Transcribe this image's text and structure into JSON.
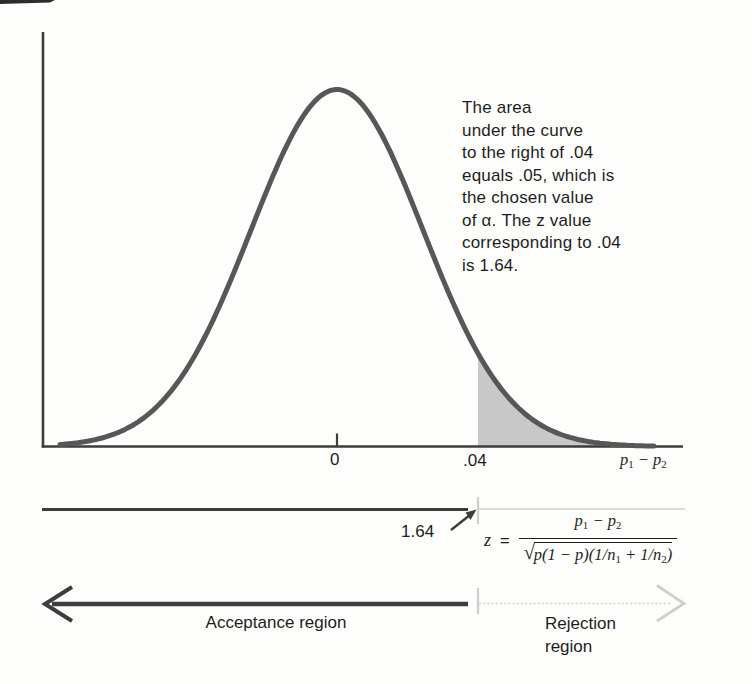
{
  "figure": {
    "colors": {
      "paper": "#fdfdfc",
      "ink": "#3d3d3d",
      "curve": "#575757",
      "light": "#cfcfcf",
      "shade": "#c8c8c8",
      "text": "#1d1d1d",
      "artifact": "#2c2c2c"
    }
  },
  "annotation": {
    "lines": [
      "The area",
      "under the curve",
      "to the right of .04",
      "equals .05, which is",
      "the chosen value",
      "of α. The z value",
      "corresponding to .04",
      "is 1.64."
    ]
  },
  "axis": {
    "tick_zero": "0",
    "tick_critical": ".04"
  },
  "p_diff": {
    "a": "p",
    "a_sub": "1",
    "minus": "−",
    "b": "p",
    "b_sub": "2"
  },
  "z_pointer": {
    "label": "1.64"
  },
  "z_formula": {
    "lhs": "z",
    "equals": "=",
    "den": {
      "radical": "√",
      "part1": "p(1 − p)(1/n",
      "sub1": "1",
      "part2": " + 1/n",
      "sub2": "2",
      "part3": ")"
    }
  },
  "regions": {
    "acceptance": "Acceptance region",
    "rejection_line1": "Rejection",
    "rejection_line2": "region"
  },
  "chart_data": {
    "type": "area",
    "distribution": "normal",
    "xlabel": "p₁ − p₂",
    "x_ticks": [
      {
        "x": 0,
        "label": "0"
      },
      {
        "x": 0.04,
        "label": ".04"
      }
    ],
    "mean": 0,
    "critical_value": 0.04,
    "critical_z": 1.64,
    "alpha": 0.05,
    "shaded_region": {
      "from": 0.04,
      "direction": "right",
      "area": 0.05
    },
    "regions": [
      {
        "label": "Acceptance region",
        "side": "left of 0.04"
      },
      {
        "label": "Rejection region",
        "side": "right of 0.04"
      }
    ],
    "grid": false,
    "legend": false
  }
}
